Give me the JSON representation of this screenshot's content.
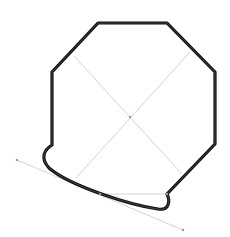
{
  "diagram": {
    "title": "",
    "width": 230,
    "height": 237,
    "colors": {
      "shape_stroke": "#111111",
      "guide_stroke": "#c8c8c8",
      "point_fill": "#9a9a9a",
      "background": "#ffffff"
    },
    "shape": {
      "type": "octagon-with-curved-edge",
      "path": "M 167 194 L 215 144 L 215 72 L 167 23 L 98 23 L 52 72 L 52 145 C 44 150 40 158 49 168 C 70 186 130 205 158 209 C 170 211 170 200 167 194 Z"
    },
    "guides": {
      "diagonal_1": {
        "x1": 74,
        "y1": 56,
        "x2": 182,
        "y2": 174
      },
      "diagonal_2": {
        "x1": 190,
        "y1": 52,
        "x2": 76,
        "y2": 178
      },
      "tangent": {
        "x1": 17,
        "y1": 160,
        "x2": 183,
        "y2": 230
      },
      "chord": {
        "x1": 100,
        "y1": 194,
        "x2": 167,
        "y2": 194
      }
    },
    "points": [
      {
        "name": "tangent-start",
        "x": 17,
        "y": 160
      },
      {
        "name": "tangent-end",
        "x": 183,
        "y": 230
      },
      {
        "name": "chord-left",
        "x": 100,
        "y": 194
      },
      {
        "name": "chord-right",
        "x": 167,
        "y": 194
      },
      {
        "name": "center",
        "x": 130,
        "y": 117
      }
    ]
  }
}
